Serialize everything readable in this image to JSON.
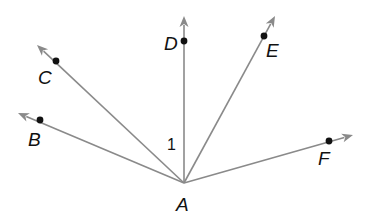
{
  "diagram": {
    "type": "rays-from-common-vertex",
    "vertex": {
      "label": "A",
      "x": 184,
      "y": 183
    },
    "rays": [
      {
        "name": "B",
        "label": "B",
        "point": [
          40,
          120
        ],
        "tip": [
          18,
          113
        ],
        "label_pos": [
          28,
          146
        ]
      },
      {
        "name": "C",
        "label": "C",
        "point": [
          56,
          61
        ],
        "tip": [
          37,
          45
        ],
        "label_pos": [
          38,
          84
        ]
      },
      {
        "name": "D",
        "label": "D",
        "point": [
          184,
          41
        ],
        "tip": [
          184,
          16
        ],
        "label_pos": [
          164,
          50
        ]
      },
      {
        "name": "E",
        "label": "E",
        "point": [
          264,
          36
        ],
        "tip": [
          275,
          16
        ],
        "label_pos": [
          266,
          57
        ]
      },
      {
        "name": "F",
        "label": "F",
        "point": [
          329,
          141
        ],
        "tip": [
          353,
          135
        ],
        "label_pos": [
          318,
          165
        ]
      }
    ],
    "angle_label": {
      "text": "1",
      "x": 167,
      "y": 150,
      "between": [
        "B",
        "D"
      ]
    },
    "colors": {
      "ray": "#8a8a8a",
      "point": "#111111",
      "text": "#111111",
      "background": "#ffffff"
    }
  }
}
